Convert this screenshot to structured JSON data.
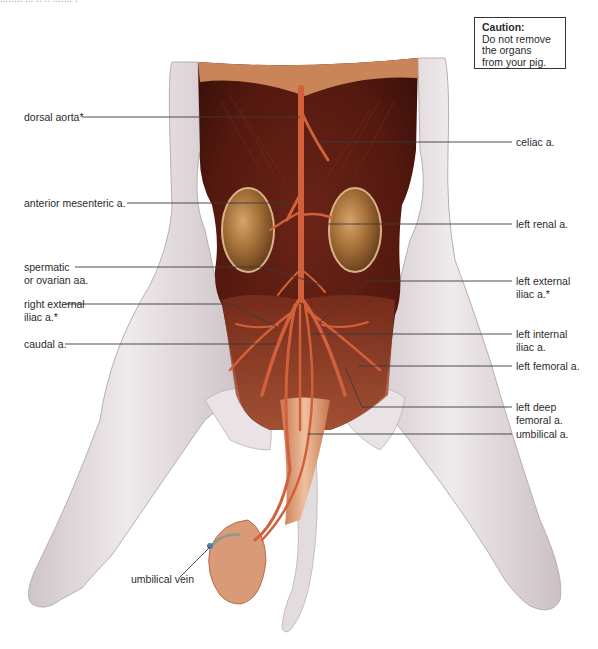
{
  "figure": {
    "top_cut_text": "........ ... .. .. ....... .",
    "caution": {
      "title": "Caution:",
      "lines": [
        "Do not remove",
        "the organs",
        "from your pig."
      ]
    },
    "colors": {
      "skin": "#e6dfe1",
      "skin_shade": "#c9bec2",
      "muscle_dark": "#5a1c14",
      "muscle_mid": "#7a2a1c",
      "artery": "#d2603a",
      "kidney": "#a8743a",
      "tendon": "#dca07c",
      "leader_line": "#3a3a3a"
    },
    "labels_left": [
      {
        "id": "dorsal-aorta",
        "lines": [
          "dorsal aorta*"
        ]
      },
      {
        "id": "anterior-mesenteric",
        "lines": [
          "anterior mesenteric a."
        ]
      },
      {
        "id": "spermatic-ovarian",
        "lines": [
          "spermatic",
          "or ovarian aa."
        ]
      },
      {
        "id": "right-external-iliac",
        "lines": [
          "right external",
          "iliac a.*"
        ]
      },
      {
        "id": "caudal",
        "lines": [
          "caudal a."
        ]
      },
      {
        "id": "umbilical-vein",
        "lines": [
          "umbilical vein"
        ]
      }
    ],
    "labels_right": [
      {
        "id": "celiac",
        "lines": [
          "celiac a."
        ]
      },
      {
        "id": "left-renal",
        "lines": [
          "left renal a."
        ]
      },
      {
        "id": "left-external-iliac",
        "lines": [
          "left external",
          "iliac a.*"
        ]
      },
      {
        "id": "left-internal-iliac",
        "lines": [
          "left internal",
          "iliac a."
        ]
      },
      {
        "id": "left-femoral",
        "lines": [
          "left femoral a."
        ]
      },
      {
        "id": "left-deep-femoral",
        "lines": [
          "left deep",
          "femoral a."
        ]
      },
      {
        "id": "umbilical-a",
        "lines": [
          "umbilical a."
        ]
      }
    ]
  }
}
